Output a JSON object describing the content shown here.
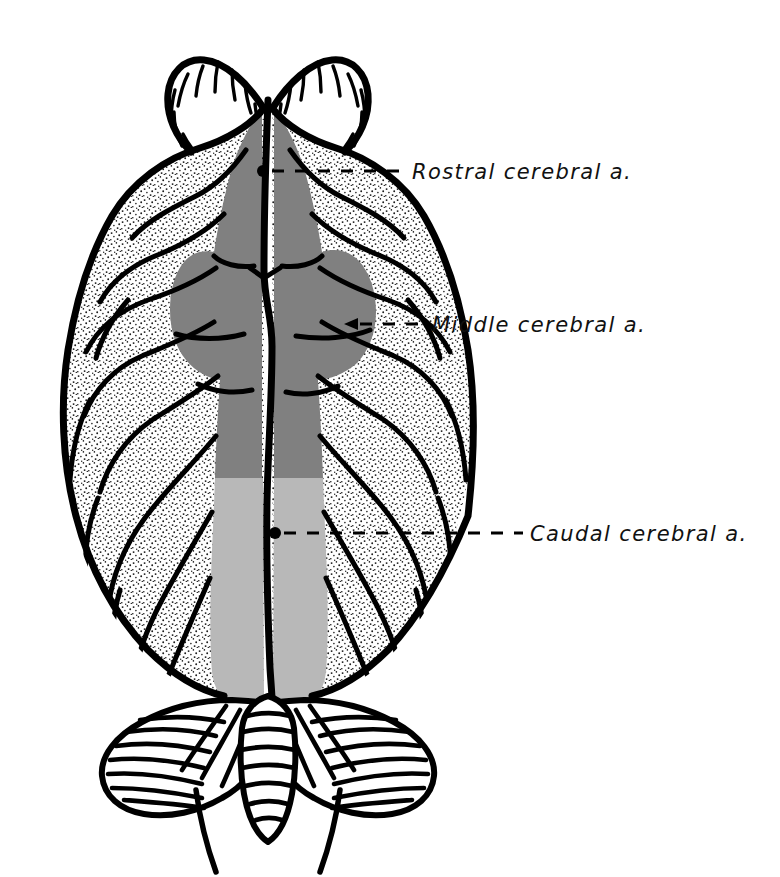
{
  "figure": {
    "view": "dorsal",
    "background_color": "#ffffff",
    "line_color": "#000000"
  },
  "territories": [
    {
      "id": "rostral",
      "name": "Rostral cerebral artery territory",
      "color": "#808080",
      "shade": "dark gray"
    },
    {
      "id": "middle",
      "name": "Middle cerebral artery territory",
      "color": "#808080",
      "shade": "dark gray"
    },
    {
      "id": "caudal",
      "name": "Caudal cerebral artery territory",
      "color": "#b8b8b8",
      "shade": "light gray"
    }
  ],
  "structures": [
    {
      "id": "olfactory-bulbs",
      "name": "Olfactory bulbs",
      "fill": "#ffffff"
    },
    {
      "id": "cerebral-hemispheres",
      "name": "Cerebral hemispheres",
      "fill": "stippled white"
    },
    {
      "id": "cerebellum",
      "name": "Cerebellum",
      "fill": "#ffffff"
    },
    {
      "id": "vermis",
      "name": "Cerebellar vermis",
      "fill": "#ffffff"
    },
    {
      "id": "medulla",
      "name": "Medulla oblongata",
      "fill": "#ffffff"
    }
  ],
  "annotations": [
    {
      "id": "rostral",
      "label": "Rostral cerebral a.",
      "text_x": 412,
      "text_y": 179,
      "marker": "dot",
      "marker_x": 263,
      "marker_y": 171,
      "leader_y": 171,
      "leader_x1": 272,
      "leader_x2": 405
    },
    {
      "id": "middle",
      "label": "Middle cerebral a.",
      "text_x": 432,
      "text_y": 332,
      "marker": "arrowhead",
      "marker_x": 352,
      "marker_y": 324,
      "leader_y": 324,
      "leader_x1": 360,
      "leader_x2": 425
    },
    {
      "id": "caudal",
      "label": "Caudal cerebral a.",
      "text_x": 530,
      "text_y": 541,
      "marker": "dot",
      "marker_x": 275,
      "marker_y": 533,
      "leader_y": 533,
      "leader_x1": 284,
      "leader_x2": 523
    }
  ]
}
